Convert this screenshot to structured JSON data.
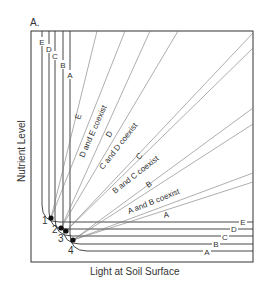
{
  "panel_label": "A.",
  "y_axis_label": "Nutrient Level",
  "x_axis_label": "Light at Soil Surface",
  "species": [
    "A",
    "B",
    "C",
    "D",
    "E"
  ],
  "vertical_isocline_labels": [
    "E",
    "D",
    "C",
    "B",
    "A"
  ],
  "horizontal_isocline_labels": [
    "E",
    "D",
    "C",
    "B",
    "A"
  ],
  "points": [
    "1",
    "2",
    "3",
    "4"
  ],
  "region_labels": {
    "E": "E",
    "DE": "D and E coexist",
    "D": "D",
    "CD": "C and D coexist",
    "C": "C",
    "BC": "B and C coexist",
    "B": "B",
    "AB": "A and B coexist",
    "A": "A"
  },
  "colors": {
    "line": "#333333",
    "thin": "#666666",
    "background": "#ffffff"
  }
}
